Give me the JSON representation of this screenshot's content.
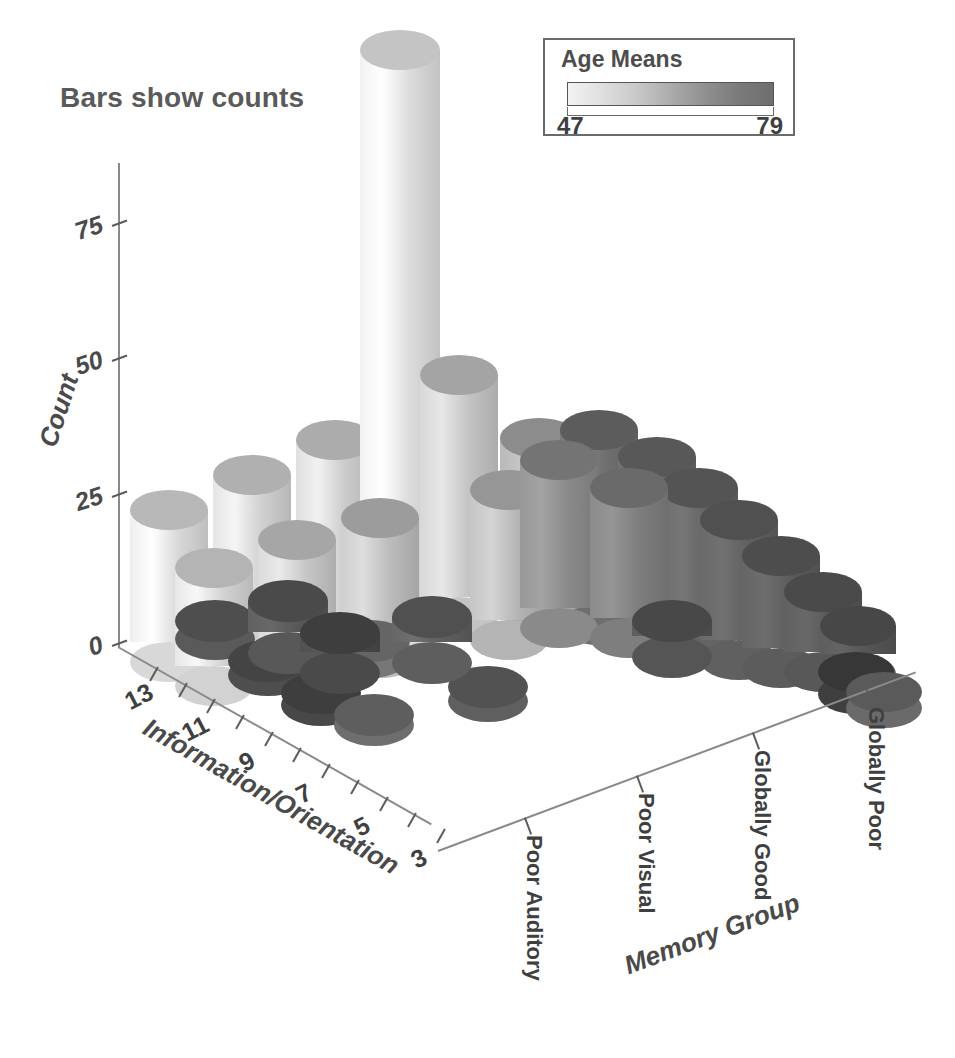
{
  "title": "Bars show counts",
  "legend": {
    "title": "Age Means",
    "min": "47",
    "max": "79",
    "ramp_low_color": "#f2f2f2",
    "ramp_high_color": "#6e6e6e"
  },
  "axes": {
    "y": {
      "title": "Count",
      "ticks": [
        "0",
        "25",
        "50",
        "75"
      ],
      "range": [
        0,
        87
      ]
    },
    "x": {
      "title": "Information/Orientation",
      "ticks": [
        "13",
        "11",
        "9",
        "7",
        "5",
        "3"
      ]
    },
    "z": {
      "title": "Memory Group",
      "ticks": [
        "Poor Auditory",
        "Poor Visual",
        "Globally Good",
        "Globally Poor"
      ]
    }
  },
  "chart_data": {
    "type": "bar",
    "title": "Bars show counts",
    "xlabel": "Information/Orientation",
    "ylabel": "Count",
    "zlabel": "Memory Group",
    "ylim": [
      0,
      87
    ],
    "grid": false,
    "legend_position": "top-right",
    "colorbar": {
      "label": "Age Means",
      "vmin": 47,
      "vmax": 79
    },
    "x_categories": [
      "13",
      "12",
      "11",
      "10",
      "9",
      "8",
      "7",
      "6",
      "5",
      "4",
      "3"
    ],
    "z_categories": [
      "Poor Auditory",
      "Poor Visual",
      "Globally Good",
      "Globally Poor"
    ],
    "series": [
      {
        "name": "Poor Auditory",
        "values": [
          14,
          19,
          26,
          31,
          86,
          28,
          18,
          0,
          0,
          0,
          0
        ],
        "age_means": [
          49,
          51,
          52,
          50,
          48,
          53,
          55,
          null,
          null,
          null,
          null
        ]
      },
      {
        "name": "Poor Visual",
        "values": [
          7,
          9,
          11,
          10,
          8,
          6,
          0,
          0,
          0,
          0,
          0
        ],
        "age_means": [
          60,
          62,
          61,
          63,
          64,
          66,
          null,
          null,
          null,
          null,
          null
        ]
      },
      {
        "name": "Globally Good",
        "values": [
          0,
          0,
          0,
          0,
          0,
          0,
          0,
          0,
          0,
          0,
          0
        ],
        "age_means": [
          null,
          null,
          null,
          null,
          null,
          null,
          70,
          null,
          null,
          null,
          null
        ]
      },
      {
        "name": "Globally Poor",
        "values": [
          0,
          0,
          0,
          24,
          21,
          18,
          14,
          10,
          6,
          3,
          0
        ],
        "age_means": [
          null,
          null,
          null,
          75,
          76,
          77,
          78,
          79,
          78,
          79,
          72
        ]
      }
    ]
  },
  "bars": [
    {
      "x": 130,
      "y": 490,
      "w": 78,
      "h": 152,
      "rx": 20,
      "fill": "#d8d8d8",
      "cap": "#b8b8b8",
      "name": "bar-pa-13"
    },
    {
      "x": 213,
      "y": 455,
      "w": 78,
      "h": 175,
      "rx": 20,
      "fill": "#d0d0d0",
      "cap": "#b0b0b0",
      "name": "bar-pa-12"
    },
    {
      "x": 296,
      "y": 420,
      "w": 78,
      "h": 200,
      "rx": 20,
      "fill": "#cccccc",
      "cap": "#acacac",
      "name": "bar-pa-11"
    },
    {
      "x": 360,
      "y": 30,
      "w": 80,
      "h": 578,
      "rx": 20,
      "fill": "#dcdcdc",
      "cap": "#c4c4c4",
      "name": "bar-pa-10"
    },
    {
      "x": 420,
      "y": 355,
      "w": 78,
      "h": 242,
      "rx": 20,
      "fill": "#c4c4c4",
      "cap": "#a4a4a4",
      "name": "bar-pa-9"
    },
    {
      "x": 500,
      "y": 418,
      "w": 78,
      "h": 172,
      "rx": 20,
      "fill": "#a8a8a8",
      "cap": "#8c8c8c",
      "name": "bar-pa-8"
    },
    {
      "x": 175,
      "y": 548,
      "w": 78,
      "h": 118,
      "rx": 20,
      "fill": "#d2d2d2",
      "cap": "#b4b4b4",
      "name": "bar-pv-13"
    },
    {
      "x": 258,
      "y": 520,
      "w": 78,
      "h": 130,
      "rx": 20,
      "fill": "#c6c6c6",
      "cap": "#a6a6a6",
      "name": "bar-pv-12"
    },
    {
      "x": 341,
      "y": 498,
      "w": 78,
      "h": 140,
      "rx": 20,
      "fill": "#bcbcbc",
      "cap": "#9c9c9c",
      "name": "bar-pv-11"
    },
    {
      "x": 470,
      "y": 470,
      "w": 78,
      "h": 150,
      "rx": 20,
      "fill": "#b4b4b4",
      "cap": "#969696",
      "name": "bar-pv-9"
    },
    {
      "x": 175,
      "y": 600,
      "w": 80,
      "h": 18,
      "rx": 21,
      "fill": "#5a5a5a",
      "cap": "#4e4e4e",
      "name": "bar-gg-13"
    },
    {
      "x": 228,
      "y": 640,
      "w": 80,
      "h": 14,
      "rx": 21,
      "fill": "#4e4e4e",
      "cap": "#444444",
      "name": "bar-gg-12"
    },
    {
      "x": 281,
      "y": 672,
      "w": 80,
      "h": 12,
      "rx": 21,
      "fill": "#484848",
      "cap": "#3e3e3e",
      "name": "bar-gg-11"
    },
    {
      "x": 334,
      "y": 694,
      "w": 80,
      "h": 10,
      "rx": 21,
      "fill": "#6e6e6e",
      "cap": "#5e5e5e",
      "name": "bar-gg-10"
    },
    {
      "x": 330,
      "y": 620,
      "w": 80,
      "h": 16,
      "rx": 21,
      "fill": "#777777",
      "cap": "#656565",
      "name": "bar-gg-9"
    },
    {
      "x": 448,
      "y": 666,
      "w": 80,
      "h": 14,
      "rx": 21,
      "fill": "#5f5f5f",
      "cap": "#525252",
      "name": "bar-gg-iso"
    },
    {
      "x": 560,
      "y": 410,
      "w": 78,
      "h": 195,
      "rx": 20,
      "fill": "#6e6e6e",
      "cap": "#5c5c5c",
      "name": "bar-gp-10"
    },
    {
      "x": 618,
      "y": 437,
      "w": 78,
      "h": 180,
      "rx": 20,
      "fill": "#686868",
      "cap": "#585858",
      "name": "bar-gp-9"
    },
    {
      "x": 660,
      "y": 468,
      "w": 78,
      "h": 160,
      "rx": 20,
      "fill": "#646464",
      "cap": "#545454",
      "name": "bar-gp-8"
    },
    {
      "x": 700,
      "y": 500,
      "w": 78,
      "h": 140,
      "rx": 20,
      "fill": "#606060",
      "cap": "#505050",
      "name": "bar-gp-7"
    },
    {
      "x": 742,
      "y": 536,
      "w": 78,
      "h": 112,
      "rx": 20,
      "fill": "#5c5c5c",
      "cap": "#4d4d4d",
      "name": "bar-gp-6"
    },
    {
      "x": 784,
      "y": 572,
      "w": 78,
      "h": 80,
      "rx": 20,
      "fill": "#585858",
      "cap": "#4a4a4a",
      "name": "bar-gp-5"
    },
    {
      "x": 820,
      "y": 606,
      "w": 76,
      "h": 48,
      "rx": 20,
      "fill": "#555555",
      "cap": "#474747",
      "name": "bar-gp-4"
    },
    {
      "x": 818,
      "y": 652,
      "w": 76,
      "h": 22,
      "rx": 20,
      "fill": "#3f3f3f",
      "cap": "#373737",
      "name": "bar-gp-3"
    },
    {
      "x": 846,
      "y": 672,
      "w": 76,
      "h": 16,
      "rx": 20,
      "fill": "#6a6a6a",
      "cap": "#5a5a5a",
      "name": "bar-gp-2"
    },
    {
      "x": 520,
      "y": 440,
      "w": 78,
      "h": 168,
      "rx": 20,
      "fill": "#8a8a8a",
      "cap": "#747474",
      "name": "bar-mid-a"
    },
    {
      "x": 590,
      "y": 468,
      "w": 78,
      "h": 150,
      "rx": 20,
      "fill": "#7e7e7e",
      "cap": "#6a6a6a",
      "name": "bar-mid-b"
    },
    {
      "x": 248,
      "y": 580,
      "w": 80,
      "h": 52,
      "rx": 21,
      "fill": "#585858",
      "cap": "#4a4a4a",
      "name": "bar-front-a"
    },
    {
      "x": 300,
      "y": 612,
      "w": 80,
      "h": 40,
      "rx": 21,
      "fill": "#4a4a4a",
      "cap": "#3e3e3e",
      "name": "bar-front-b"
    },
    {
      "x": 392,
      "y": 596,
      "w": 80,
      "h": 46,
      "rx": 21,
      "fill": "#5e5e5e",
      "cap": "#505050",
      "name": "bar-front-c"
    },
    {
      "x": 632,
      "y": 600,
      "w": 80,
      "h": 36,
      "rx": 21,
      "fill": "#555555",
      "cap": "#484848",
      "name": "bar-front-d"
    }
  ]
}
